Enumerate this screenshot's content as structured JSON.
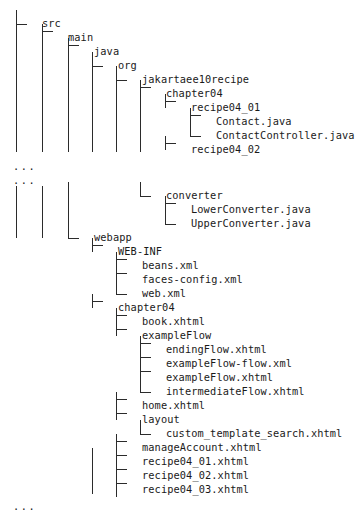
{
  "diagram": {
    "kind": "ascii-file-tree",
    "colors": {
      "text": "#1a1a1a",
      "line": "#2b2b2b",
      "background": "#ffffff"
    },
    "ellipsis_glyph": "...",
    "metrics": {
      "row_height": 14,
      "first_row_y": 17,
      "level_x": [
        16,
        42,
        68,
        92,
        116,
        140,
        165,
        190
      ],
      "label_offset": 26
    },
    "rows": [
      {
        "id": "r0",
        "y": 17,
        "level": 1,
        "connector": "elbow",
        "label": "src",
        "type": "folder"
      },
      {
        "id": "r1",
        "y": 31,
        "level": 2,
        "connector": "tee",
        "label": "main",
        "type": "folder"
      },
      {
        "id": "r2",
        "y": 45,
        "level": 3,
        "connector": "tee",
        "label": "java",
        "type": "folder"
      },
      {
        "id": "r3",
        "y": 59,
        "level": 4,
        "connector": "elbow",
        "label": "org",
        "type": "folder"
      },
      {
        "id": "r4",
        "y": 73,
        "level": 5,
        "connector": "elbow",
        "label": "jakartaee10recipe",
        "type": "folder"
      },
      {
        "id": "r5",
        "y": 87,
        "level": 6,
        "connector": "tee",
        "label": "chapter04",
        "type": "folder"
      },
      {
        "id": "r6",
        "y": 101,
        "level": 7,
        "connector": "tee",
        "label": "recipe04_01",
        "type": "folder"
      },
      {
        "id": "r7",
        "y": 115,
        "level": 8,
        "connector": "tee",
        "label": "Contact.java",
        "type": "file"
      },
      {
        "id": "r8",
        "y": 129,
        "level": 8,
        "connector": "elbow",
        "label": "ContactController.java",
        "type": "file"
      },
      {
        "id": "r9",
        "y": 143,
        "level": 7,
        "connector": "tee",
        "label": "recipe04_02",
        "type": "folder"
      },
      {
        "id": "r10",
        "y": 159,
        "level": 0,
        "connector": "none",
        "label": "...",
        "type": "ellipsis"
      },
      {
        "id": "r11",
        "y": 173,
        "level": 0,
        "connector": "none",
        "label": "...",
        "type": "ellipsis"
      },
      {
        "id": "r12",
        "y": 189,
        "level": 6,
        "connector": "elbow",
        "label": "converter",
        "type": "folder"
      },
      {
        "id": "r13",
        "y": 203,
        "level": 7,
        "connector": "tee",
        "label": "LowerConverter.java",
        "type": "file"
      },
      {
        "id": "r14",
        "y": 217,
        "level": 7,
        "connector": "elbow",
        "label": "UpperConverter.java",
        "type": "file"
      },
      {
        "id": "r15",
        "y": 231,
        "level": 3,
        "connector": "elbow",
        "label": "webapp",
        "type": "folder"
      },
      {
        "id": "r16",
        "y": 245,
        "level": 4,
        "connector": "tee",
        "label": "WEB-INF",
        "type": "folder"
      },
      {
        "id": "r17",
        "y": 259,
        "level": 5,
        "connector": "tee",
        "label": "beans.xml",
        "type": "file"
      },
      {
        "id": "r18",
        "y": 273,
        "level": 5,
        "connector": "tee",
        "label": "faces-config.xml",
        "type": "file"
      },
      {
        "id": "r19",
        "y": 287,
        "level": 5,
        "connector": "elbow",
        "label": "web.xml",
        "type": "file"
      },
      {
        "id": "r20",
        "y": 301,
        "level": 4,
        "connector": "tee",
        "label": "chapter04",
        "type": "folder"
      },
      {
        "id": "r21",
        "y": 315,
        "level": 5,
        "connector": "tee",
        "label": "book.xhtml",
        "type": "file"
      },
      {
        "id": "r22",
        "y": 329,
        "level": 5,
        "connector": "tee",
        "label": "exampleFlow",
        "type": "folder"
      },
      {
        "id": "r23",
        "y": 343,
        "level": 6,
        "connector": "tee",
        "label": "endingFlow.xhtml",
        "type": "file"
      },
      {
        "id": "r24",
        "y": 357,
        "level": 6,
        "connector": "tee",
        "label": "exampleFlow-flow.xml",
        "type": "file"
      },
      {
        "id": "r25",
        "y": 371,
        "level": 6,
        "connector": "tee",
        "label": "exampleFlow.xhtml",
        "type": "file"
      },
      {
        "id": "r26",
        "y": 385,
        "level": 6,
        "connector": "elbow",
        "label": "intermediateFlow.xhtml",
        "type": "file"
      },
      {
        "id": "r27",
        "y": 399,
        "level": 5,
        "connector": "tee",
        "label": "home.xhtml",
        "type": "file"
      },
      {
        "id": "r28",
        "y": 413,
        "level": 5,
        "connector": "tee",
        "label": "layout",
        "type": "folder"
      },
      {
        "id": "r29",
        "y": 427,
        "level": 6,
        "connector": "elbow",
        "label": "custom_template_search.xhtml",
        "type": "file"
      },
      {
        "id": "r30",
        "y": 441,
        "level": 5,
        "connector": "tee",
        "label": "manageAccount.xhtml",
        "type": "file"
      },
      {
        "id": "r31",
        "y": 455,
        "level": 5,
        "connector": "tee",
        "label": "recipe04_01.xhtml",
        "type": "file"
      },
      {
        "id": "r32",
        "y": 469,
        "level": 5,
        "connector": "tee",
        "label": "recipe04_02.xhtml",
        "type": "file"
      },
      {
        "id": "r33",
        "y": 483,
        "level": 5,
        "connector": "tee",
        "label": "recipe04_03.xhtml",
        "type": "file"
      },
      {
        "id": "r34",
        "y": 499,
        "level": 0,
        "connector": "none",
        "label": "...",
        "type": "ellipsis"
      }
    ],
    "guides": [
      {
        "id": "g1",
        "level": 1,
        "y1": 24,
        "y2": 152
      },
      {
        "id": "g2",
        "level": 2,
        "y1": 38,
        "y2": 152
      },
      {
        "id": "g3",
        "level": 3,
        "y1": 52,
        "y2": 152
      },
      {
        "id": "g4",
        "level": 4,
        "y1": 66,
        "y2": 152
      },
      {
        "id": "g5",
        "level": 5,
        "y1": 80,
        "y2": 152
      },
      {
        "id": "g6",
        "level": 6,
        "y1": 94,
        "y2": 152
      },
      {
        "id": "g7",
        "level": 1,
        "y1": 186,
        "y2": 238
      },
      {
        "id": "g8",
        "level": 2,
        "y1": 186,
        "y2": 238
      },
      {
        "id": "g9",
        "level": 3,
        "y1": 182,
        "y2": 226
      },
      {
        "id": "g10",
        "level": 4,
        "y1": 448,
        "y2": 494
      },
      {
        "id": "g11",
        "level": 5,
        "y1": 490,
        "y2": 497
      }
    ]
  }
}
